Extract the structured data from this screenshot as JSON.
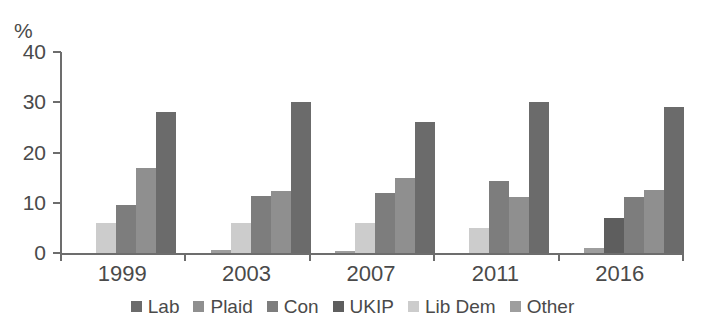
{
  "chart_data": {
    "type": "bar",
    "title": "",
    "subtitle": "",
    "xlabel": "",
    "ylabel": "%",
    "ylim": [
      0,
      40
    ],
    "yticks": [
      0,
      10,
      20,
      30,
      40
    ],
    "ytick_labels": [
      "0",
      "10",
      "20",
      "30",
      "40"
    ],
    "grid": false,
    "legend_position": "bottom",
    "bar_draw_order": "reverse-legend (Other leftmost, Lab rightmost)",
    "categories": [
      "1999",
      "2003",
      "2007",
      "2011",
      "2016"
    ],
    "series": [
      {
        "name": "Lab",
        "color": "#6b6b6b",
        "values": [
          28,
          30,
          26,
          30,
          29
        ]
      },
      {
        "name": "Plaid",
        "color": "#8f8f8f",
        "values": [
          17,
          12.3,
          15,
          11.2,
          12.5
        ]
      },
      {
        "name": "Con",
        "color": "#7d7d7d",
        "values": [
          9.5,
          11.3,
          12,
          14.3,
          11.2
        ]
      },
      {
        "name": "UKIP",
        "color": "#5e5e5e",
        "values": [
          null,
          null,
          null,
          null,
          7
        ]
      },
      {
        "name": "Lib Dem",
        "color": "#cccccc",
        "values": [
          6,
          6,
          6,
          5,
          null
        ]
      },
      {
        "name": "Other",
        "color": "#9e9e9e",
        "values": [
          null,
          0.6,
          0.5,
          null,
          1
        ]
      }
    ],
    "legend": [
      "Lab",
      "Plaid",
      "Con",
      "UKIP",
      "Lib Dem",
      "Other"
    ]
  },
  "axis": {
    "y_unit_label": "%",
    "tick_labels": [
      "40",
      "30",
      "20",
      "10",
      "0"
    ]
  },
  "colors": {
    "axis": "#6d6d6d",
    "text": "#4a4a4a",
    "background": "#ffffff"
  }
}
